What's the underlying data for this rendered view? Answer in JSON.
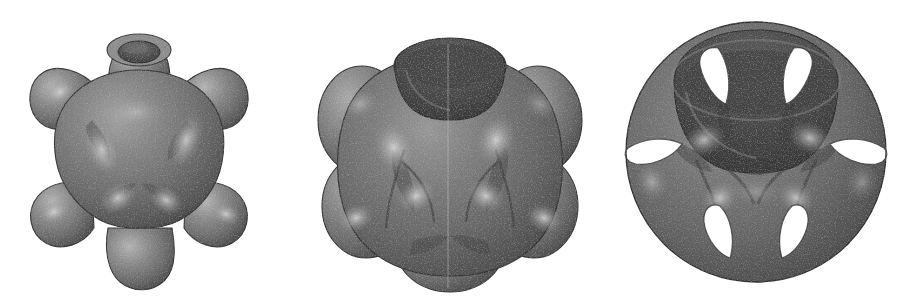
{
  "figure": {
    "background_color": "#ffffff",
    "width": 913,
    "height": 300,
    "panel_count": 3,
    "render_style": "grayscale-dithered-raytrace",
    "caption": ""
  },
  "palette": {
    "background": "#ffffff",
    "body_mid": "#767676",
    "body_dark": "#4a4a4a",
    "body_darker": "#3a3a3a",
    "body_light": "#9a9a9a",
    "highlight": "#c4c4c4",
    "specular": "#e2e2e2",
    "bore_dark": "#555555",
    "bore_darkest": "#3f3f3f",
    "rim": "#8a8a8a",
    "outline": "#2e2e2e",
    "seam": "#bdbdbd",
    "hole_fill": "#ffffff"
  },
  "panels": [
    {
      "id": "panel-a",
      "name": "sphere-with-six-cylindrical-bosses",
      "label": "",
      "description": "Rounded blob with six outward cylindrical protrusions, small open bore at top",
      "center_x": 138,
      "center_y": 155,
      "body_radius": 74,
      "boss_count": 6,
      "top_bore": {
        "visible": true,
        "outer_rx": 32,
        "outer_ry": 16,
        "inner_rx": 20,
        "inner_ry": 10,
        "cy": 44
      },
      "bosses": [
        {
          "angle_deg": 90,
          "name": "boss-top",
          "length": 40,
          "radius": 30
        },
        {
          "angle_deg": 150,
          "name": "boss-upper-left",
          "length": 42,
          "radius": 32
        },
        {
          "angle_deg": 210,
          "name": "boss-lower-left",
          "length": 42,
          "radius": 34
        },
        {
          "angle_deg": 270,
          "name": "boss-bottom",
          "length": 40,
          "radius": 32
        },
        {
          "angle_deg": 330,
          "name": "boss-lower-right",
          "length": 42,
          "radius": 34
        },
        {
          "angle_deg": 30,
          "name": "boss-upper-right",
          "length": 42,
          "radius": 32
        }
      ]
    },
    {
      "id": "panel-b",
      "name": "cube-blob-with-large-bore",
      "label": "",
      "description": "Six overlapping spheres fused into a cube-like blob, large open cylinder bore at top, faint vertical seam",
      "center_x": 150,
      "center_y": 160,
      "body_radius": 100,
      "lobe_count": 6,
      "top_bore": {
        "visible": true,
        "outer_rx": 55,
        "outer_ry": 26,
        "inner_rx": 46,
        "inner_ry": 21,
        "cy": 56
      },
      "seam": {
        "visible": true,
        "x": 148,
        "y_top": 40,
        "y_bottom": 286
      }
    },
    {
      "id": "panel-c",
      "name": "hollow-shell-with-six-openings",
      "label": "",
      "description": "Thin hollowed sphere shell, large top opening and six triangular cut-through windows revealing white background",
      "center_x": 148,
      "center_y": 152,
      "body_radius": 128,
      "top_bore": {
        "visible": true,
        "outer_rx": 84,
        "outer_ry": 40,
        "inner_rx": 72,
        "inner_ry": 32,
        "cy": 72
      },
      "window_count": 6,
      "windows": [
        {
          "name": "window-upper-left",
          "cx": 101,
          "cy": 74,
          "w": 34,
          "h": 56
        },
        {
          "name": "window-upper-right",
          "cx": 196,
          "cy": 74,
          "w": 34,
          "h": 56
        },
        {
          "name": "window-mid-left",
          "cx": 48,
          "cy": 153,
          "w": 50,
          "h": 30
        },
        {
          "name": "window-mid-right",
          "cx": 250,
          "cy": 153,
          "w": 50,
          "h": 30
        },
        {
          "name": "window-lower-left",
          "cx": 106,
          "cy": 233,
          "w": 34,
          "h": 52
        },
        {
          "name": "window-lower-right",
          "cx": 192,
          "cy": 233,
          "w": 34,
          "h": 52
        }
      ]
    }
  ]
}
